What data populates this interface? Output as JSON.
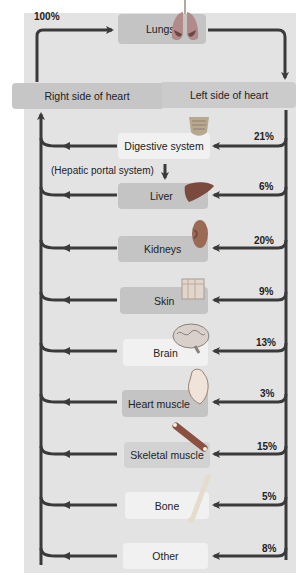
{
  "diagram": {
    "type": "blood-flow-distribution",
    "top_percent": "100%",
    "lungs": "Lungs",
    "right_heart": "Right side of heart",
    "left_heart": "Left side of heart",
    "hepatic_note": "(Hepatic portal system)",
    "organs": [
      {
        "label": "Digestive system",
        "percent": "21%",
        "icon": "intestine-icon"
      },
      {
        "label": "Liver",
        "percent": "6%",
        "icon": "liver-icon"
      },
      {
        "label": "Kidneys",
        "percent": "20%",
        "icon": "kidney-icon"
      },
      {
        "label": "Skin",
        "percent": "9%",
        "icon": "skin-icon"
      },
      {
        "label": "Brain",
        "percent": "13%",
        "icon": "brain-icon"
      },
      {
        "label": "Heart muscle",
        "percent": "3%",
        "icon": "heart-icon"
      },
      {
        "label": "Skeletal muscle",
        "percent": "15%",
        "icon": "muscle-icon"
      },
      {
        "label": "Bone",
        "percent": "5%",
        "icon": "bone-icon"
      },
      {
        "label": "Other",
        "percent": "8%",
        "icon": ""
      }
    ],
    "colors": {
      "arrow": "#3a3a3a",
      "panel": "#e3e3e3",
      "box_dark": "#c4c4c4",
      "box_light": "#f1f1f1"
    }
  }
}
